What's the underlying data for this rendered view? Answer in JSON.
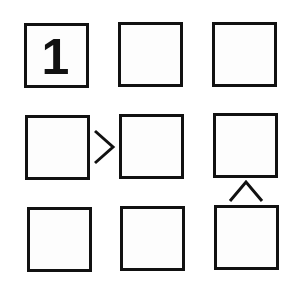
{
  "puzzle": {
    "type": "futoshiki",
    "size": 3,
    "cells": [
      [
        "1",
        "",
        ""
      ],
      [
        "",
        "",
        ""
      ],
      [
        "",
        "",
        ""
      ]
    ],
    "constraints": [
      {
        "from": [
          1,
          0
        ],
        "to": [
          1,
          1
        ],
        "symbol": ">",
        "direction": "horizontal"
      },
      {
        "from": [
          1,
          2
        ],
        "to": [
          2,
          2
        ],
        "symbol": "^",
        "direction": "vertical",
        "meaning": "top < bottom"
      }
    ],
    "colors": {
      "ink": "#111111",
      "background": "#ffffff",
      "cell_fill": "#fdfdfd"
    }
  }
}
